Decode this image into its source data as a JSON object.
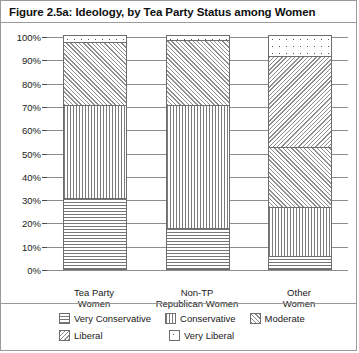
{
  "figure": {
    "title": "Figure 2.5a: Ideology, by Tea Party Status among Women"
  },
  "chart_data": {
    "type": "bar",
    "stacked": true,
    "title": "Figure 2.5a: Ideology, by Tea Party Status among Women",
    "xlabel": "",
    "ylabel": "",
    "ylim": [
      0,
      100
    ],
    "ytick_labels": [
      "100%",
      "90%",
      "80%",
      "70%",
      "60%",
      "50%",
      "40%",
      "30%",
      "20%",
      "10%",
      "0%"
    ],
    "ytick_values": [
      100,
      90,
      80,
      70,
      60,
      50,
      40,
      30,
      20,
      10,
      0
    ],
    "grid": true,
    "legend_position": "bottom",
    "categories": [
      "Tea Party Women",
      "Non-TP Republican Women",
      "Other Women"
    ],
    "category_lines": [
      [
        "Tea Party",
        "Women"
      ],
      [
        "Non-TP",
        "Republican Women"
      ],
      [
        "Other",
        "Women"
      ]
    ],
    "series": [
      {
        "name": "Very Conservative",
        "pattern": "horizontal-lines",
        "values": [
          30,
          17,
          5
        ]
      },
      {
        "name": "Conservative",
        "pattern": "vertical-lines",
        "values": [
          40,
          53,
          21
        ]
      },
      {
        "name": "Moderate",
        "pattern": "diagonal-hatch",
        "values": [
          27,
          28,
          26
        ]
      },
      {
        "name": "Liberal",
        "pattern": "diagonal-hatch-reverse",
        "values": [
          0,
          0,
          39
        ]
      },
      {
        "name": "Very Liberal",
        "pattern": "dots",
        "values": [
          3,
          2,
          9
        ]
      }
    ]
  },
  "legend": {
    "items": [
      {
        "label": "Very Conservative",
        "pattern": "horizontal-lines"
      },
      {
        "label": "Conservative",
        "pattern": "vertical-lines"
      },
      {
        "label": "Moderate",
        "pattern": "diagonal-hatch"
      },
      {
        "label": "Liberal",
        "pattern": "diagonal-hatch-reverse"
      },
      {
        "label": "Very Liberal",
        "pattern": "dots"
      }
    ]
  }
}
